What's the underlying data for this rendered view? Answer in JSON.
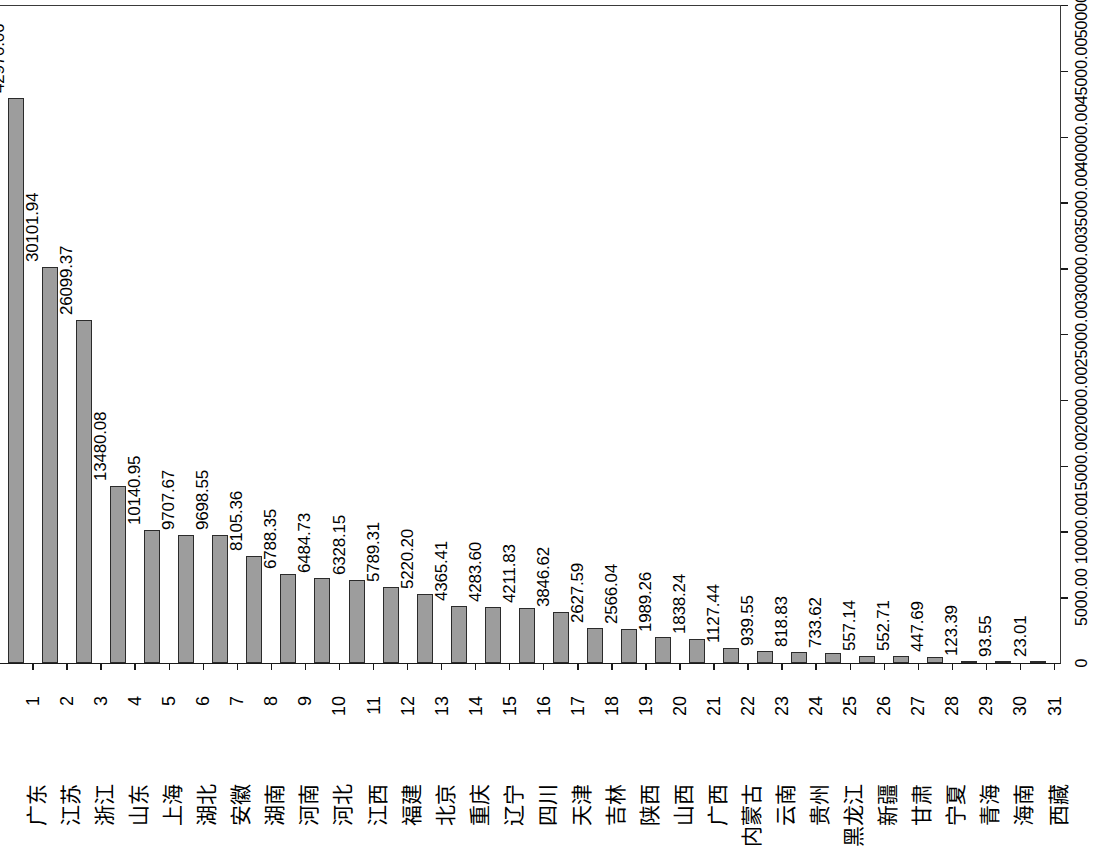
{
  "chart_data": {
    "type": "bar",
    "title": "",
    "subtitle": "",
    "xlabel": "",
    "ylabel": "",
    "ylim": [
      0,
      50000
    ],
    "grid": false,
    "legend": null,
    "y_axis_position": "right",
    "x_tick_labels_rotated": true,
    "value_labels_shown": true,
    "categories": [
      "广东",
      "江苏",
      "浙江",
      "山东",
      "上海",
      "湖北",
      "安徽",
      "湖南",
      "河南",
      "河北",
      "江西",
      "福建",
      "北京",
      "重庆",
      "辽宁",
      "四川",
      "天津",
      "吉林",
      "陕西",
      "山西",
      "广西",
      "内蒙古",
      "云南",
      "贵州",
      "黑龙江",
      "新疆",
      "甘肃",
      "宁夏",
      "青海",
      "海南",
      "西藏"
    ],
    "indices": [
      "1",
      "2",
      "3",
      "4",
      "5",
      "6",
      "7",
      "8",
      "9",
      "10",
      "11",
      "12",
      "13",
      "14",
      "15",
      "16",
      "17",
      "18",
      "19",
      "20",
      "21",
      "22",
      "23",
      "24",
      "25",
      "26",
      "27",
      "28",
      "29",
      "30",
      "31"
    ],
    "values": [
      42970.06,
      30101.94,
      26099.37,
      13480.08,
      10140.95,
      9707.67,
      9698.55,
      8105.36,
      6788.35,
      6484.73,
      6328.15,
      5789.31,
      5220.2,
      4365.41,
      4283.6,
      4211.83,
      3846.62,
      2627.59,
      2566.04,
      1989.26,
      1838.24,
      1127.44,
      939.55,
      818.83,
      733.62,
      557.14,
      552.71,
      447.69,
      123.39,
      93.55,
      23.01
    ],
    "value_labels": [
      "42970.06",
      "30101.94",
      "26099.37",
      "13480.08",
      "10140.95",
      "9707.67",
      "9698.55",
      "8105.36",
      "6788.35",
      "6484.73",
      "6328.15",
      "5789.31",
      "5220.20",
      "4365.41",
      "4283.60",
      "4211.83",
      "3846.62",
      "2627.59",
      "2566.04",
      "1989.26",
      "1838.24",
      "1127.44",
      "939.55",
      "818.83",
      "733.62",
      "557.14",
      "552.71",
      "447.69",
      "123.39",
      "93.55",
      "23.01"
    ],
    "y_ticks": [
      0,
      5000,
      10000,
      15000,
      20000,
      25000,
      30000,
      35000,
      40000,
      45000,
      50000
    ],
    "y_tick_labels": [
      "0",
      "5000.00",
      "10000.00",
      "15000.00",
      "20000.00",
      "25000.00",
      "30000.00",
      "35000.00",
      "40000.00",
      "45000.00",
      "50000.00"
    ],
    "colors": {
      "bar_fill": "#9d9d9d",
      "bar_border": "#2b2b2b",
      "axis": "#1a1a1a",
      "text": "#000000",
      "background": "#ffffff"
    }
  }
}
